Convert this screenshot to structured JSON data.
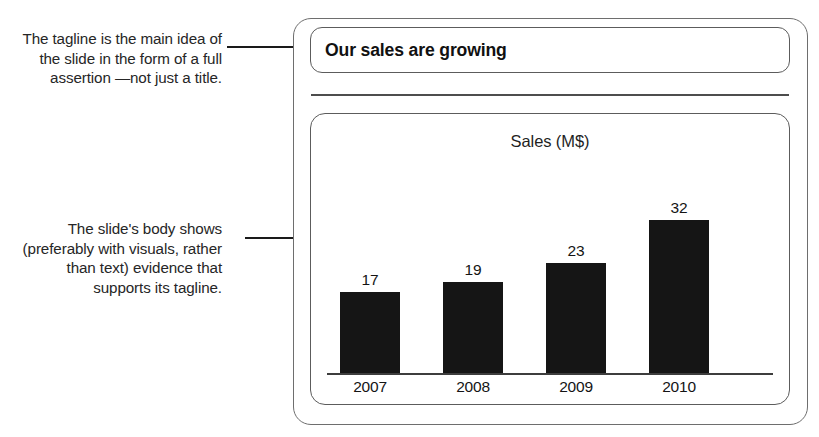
{
  "annotations": [
    {
      "id": "tagline",
      "text": "The tagline is the main idea of the slide in the form of a full assertion —not just a title."
    },
    {
      "id": "body",
      "text": "The slide's body shows (preferably with visuals, rather than text) evidence that supports its tagline."
    }
  ],
  "slide": {
    "title": "Our sales are growing"
  },
  "chart_data": {
    "type": "bar",
    "title": "Sales (M$)",
    "categories": [
      "2007",
      "2008",
      "2009",
      "2010"
    ],
    "values": [
      17,
      19,
      23,
      32
    ],
    "xlabel": "",
    "ylabel": "Sales (M$)",
    "ylim": [
      0,
      35
    ],
    "grid": false,
    "legend": "none",
    "bar_color": "#151515",
    "data_labels": [
      "17",
      "19",
      "23",
      "32"
    ]
  },
  "colors": {
    "ink": "#1a1a1a",
    "frame": "#6e6e6e",
    "bar": "#151515"
  }
}
